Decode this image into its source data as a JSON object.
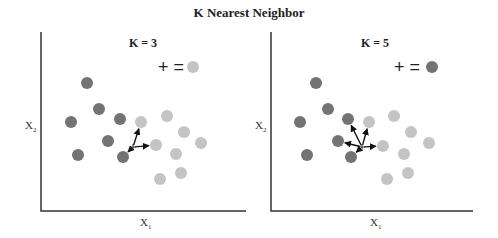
{
  "title": "K Nearest Neighbor",
  "colors": {
    "class_a": "#737373",
    "class_b": "#c4c4c4",
    "axis": "#333333",
    "arrow": "#111111"
  },
  "panels": [
    {
      "title": "K = 3",
      "k": 3,
      "xlabel": "X",
      "xlabel_sub": "1",
      "ylabel": "X",
      "ylabel_sub": "2",
      "legend_text": "+ =",
      "legend_class": "class_b",
      "query_point": [
        133,
        147
      ],
      "class_a_points": [
        [
          87,
          83
        ],
        [
          99,
          109
        ],
        [
          71,
          122
        ],
        [
          120,
          119
        ],
        [
          108,
          141
        ],
        [
          78,
          155
        ],
        [
          123,
          157
        ]
      ],
      "class_b_points": [
        [
          141,
          122
        ],
        [
          167,
          116
        ],
        [
          184,
          132
        ],
        [
          156,
          145
        ],
        [
          201,
          143
        ],
        [
          176,
          154
        ],
        [
          181,
          173
        ],
        [
          160,
          179
        ]
      ],
      "neighbors": [
        [
          141,
          122
        ],
        [
          156,
          145
        ],
        [
          123,
          157
        ]
      ]
    },
    {
      "title": "K = 5",
      "k": 5,
      "xlabel": "X",
      "xlabel_sub": "1",
      "ylabel": "X",
      "ylabel_sub": "2",
      "legend_text": "+ =",
      "legend_class": "class_a",
      "query_point": [
        362,
        147
      ],
      "class_a_points": [
        [
          316,
          83
        ],
        [
          328,
          109
        ],
        [
          300,
          122
        ],
        [
          348,
          119
        ],
        [
          338,
          141
        ],
        [
          307,
          155
        ],
        [
          351,
          157
        ]
      ],
      "class_b_points": [
        [
          369,
          122
        ],
        [
          394,
          116
        ],
        [
          411,
          132
        ],
        [
          383,
          146
        ],
        [
          429,
          143
        ],
        [
          404,
          154
        ],
        [
          408,
          173
        ],
        [
          387,
          179
        ]
      ],
      "neighbors": [
        [
          369,
          122
        ],
        [
          348,
          119
        ],
        [
          338,
          141
        ],
        [
          383,
          146
        ],
        [
          351,
          157
        ]
      ]
    }
  ]
}
